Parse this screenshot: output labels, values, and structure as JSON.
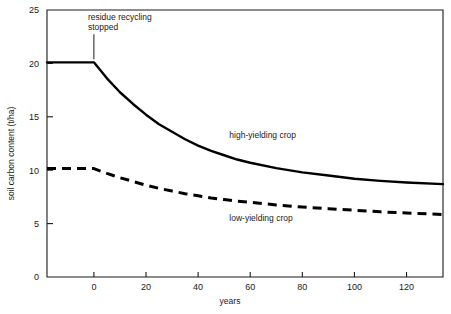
{
  "chart_data": {
    "type": "line",
    "title": "",
    "xlabel": "years",
    "ylabel": "soil carbon content (t/ha)",
    "xlim": [
      -18,
      134
    ],
    "ylim": [
      0,
      25
    ],
    "grid": false,
    "legend_position": "inline-labels",
    "xticks": [
      0,
      20,
      40,
      60,
      80,
      100,
      120
    ],
    "xtick_labels": [
      "0",
      "20",
      "40",
      "60",
      "80",
      "100",
      "120"
    ],
    "yticks": [
      0,
      5,
      10,
      15,
      20,
      25
    ],
    "ytick_labels": [
      "0",
      "5",
      "10",
      "15",
      "20",
      "25"
    ],
    "annotations": [
      {
        "name": "residue-recycling-stopped",
        "line1": "residue recycling",
        "line2": "stopped",
        "x": 0,
        "y": 20.1
      }
    ],
    "series": [
      {
        "name": "high-yielding crop",
        "label": "high-yielding crop",
        "style": "solid",
        "color": "#000000",
        "label_x": 52,
        "label_y": 13.0,
        "x": [
          -18,
          -12,
          -6,
          0,
          5,
          10,
          15,
          20,
          25,
          30,
          35,
          40,
          45,
          50,
          55,
          60,
          70,
          80,
          90,
          100,
          110,
          120,
          134
        ],
        "y": [
          20.1,
          20.1,
          20.1,
          20.1,
          18.6,
          17.3,
          16.2,
          15.2,
          14.3,
          13.6,
          12.9,
          12.3,
          11.8,
          11.4,
          11.0,
          10.7,
          10.2,
          9.8,
          9.5,
          9.2,
          9.0,
          8.85,
          8.7
        ]
      },
      {
        "name": "low-yielding crop",
        "label": "low-yielding crop",
        "style": "dashed",
        "color": "#000000",
        "label_x": 52,
        "label_y": 5.2,
        "x": [
          -18,
          -12,
          -6,
          0,
          5,
          10,
          15,
          20,
          25,
          30,
          35,
          40,
          45,
          50,
          55,
          60,
          70,
          80,
          90,
          100,
          110,
          120,
          134
        ],
        "y": [
          10.15,
          10.15,
          10.15,
          10.15,
          9.7,
          9.3,
          8.95,
          8.6,
          8.3,
          8.05,
          7.8,
          7.6,
          7.4,
          7.25,
          7.1,
          7.0,
          6.75,
          6.55,
          6.4,
          6.25,
          6.1,
          6.0,
          5.85
        ]
      }
    ],
    "colors": {
      "axis": "#1a1a1a",
      "background": "#ffffff",
      "series": "#000000"
    }
  }
}
